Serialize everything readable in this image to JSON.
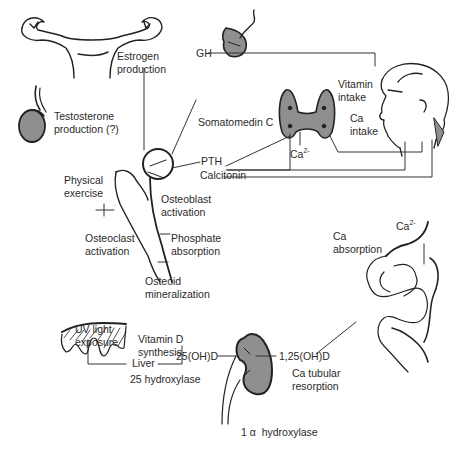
{
  "diagram": {
    "organs": [
      "uterus-ovaries",
      "testis",
      "pituitary",
      "thyroid-parathyroid",
      "head",
      "femur",
      "skin",
      "kidney",
      "intestine"
    ],
    "labels": {
      "estrogen": "Estrogen\nproduction",
      "testosterone": "Testosterone\nproduction (?)",
      "gh": "GH",
      "vitamin_intake": "Vitamin\nintake",
      "ca_intake": "Ca\nintake",
      "somatomedin": "Somatomedin C",
      "pth": "PTH",
      "ca2_thyroid": "Ca",
      "ca2_sup": "2-",
      "calcitonin": "Calcitonin",
      "physical_exercise": "Physical\nexercise",
      "osteoblast": "Osteoblast\nactivation",
      "osteoclast": "Osteoclast\nactivation",
      "phosphate": "Phosphate\nabsorption",
      "osteoid": "Osteoid\nmineralization",
      "ca2_gut": "Ca",
      "ca2_gut_sup": "2-",
      "ca_absorption": "Ca\nabsorption",
      "uv_light": "UV light\nexposure",
      "vitd_synthesis": "Vitamin D\nsynthesis",
      "liver": "Liver",
      "hydroxylase25": "25 hydroxylase",
      "ohd25": "25(OH)D",
      "ohd125": "1,25(OH)D",
      "ca_tubular": "Ca tubular\nresorption",
      "hydroxylase1a": "1 α  hydroxylase"
    },
    "colors": {
      "organ_fill": "#8f8f8f",
      "line": "#222222",
      "text": "#2a2a2a"
    }
  }
}
